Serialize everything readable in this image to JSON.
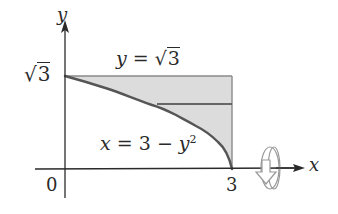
{
  "diagram": {
    "axes": {
      "x_label": "x",
      "y_label": "y",
      "origin_label": "0"
    },
    "ticks": {
      "x_tick_label": "3",
      "y_tick_radicand": "3",
      "y_tick_sqrt_symbol": "√"
    },
    "curves": {
      "top_line": {
        "lhs": "y",
        "eq": "=",
        "sqrt_symbol": "√",
        "radicand": "3"
      },
      "parabola": {
        "lhs": "x",
        "eq": "=",
        "const": "3",
        "minus": "−",
        "var": "y",
        "exponent": "2"
      }
    },
    "rotation_axis": "x",
    "colors": {
      "ink": "#2a2a2a",
      "curve": "#555555",
      "fill": "#dcdcdc",
      "rect_edge": "#8a8a8a",
      "strip": "#666666",
      "rotation_icon": "#999999"
    }
  }
}
